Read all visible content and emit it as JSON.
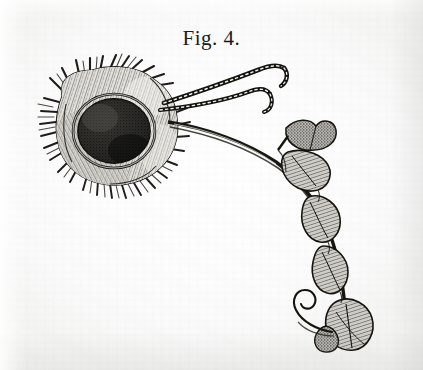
{
  "plate": {
    "caption": "Fig. 4.",
    "medium": "engraving",
    "ink_color": "#1b1b1b",
    "paper_color": "#fdfdfd",
    "width": 423,
    "height": 370
  },
  "figure": {
    "subject_label": "hairy gall body with trailing appendaged stalk",
    "parts": [
      {
        "name": "bristly-capsule",
        "description": "ragged hair-fringed capsule at upper left",
        "center_x": 118,
        "center_y": 130
      },
      {
        "name": "dark-sphere",
        "description": "dark stippled spherical body set in the capsule",
        "center_x": 114,
        "center_y": 131,
        "radius_x": 36,
        "radius_y": 32
      },
      {
        "name": "upper-filament",
        "description": "long segmented filament curving to upper right",
        "tip_x": 283,
        "tip_y": 64
      },
      {
        "name": "lower-filament",
        "description": "second segmented filament, shorter hook",
        "tip_x": 268,
        "tip_y": 96
      },
      {
        "name": "main-stalk",
        "description": "main stalk sweeping right then descending",
        "start_x": 168,
        "start_y": 122,
        "end_x": 345,
        "end_y": 330
      },
      {
        "name": "lobe-chain",
        "description": "chain of teardrop lobed appendages along the descending stalk",
        "count": 5
      },
      {
        "name": "terminal-spiral",
        "description": "spiral curl at the lower terminus",
        "center_x": 312,
        "center_y": 311
      },
      {
        "name": "terminal-flare",
        "description": "flared lobed terminal tuft at the bottom",
        "center_x": 352,
        "center_y": 333
      }
    ]
  }
}
